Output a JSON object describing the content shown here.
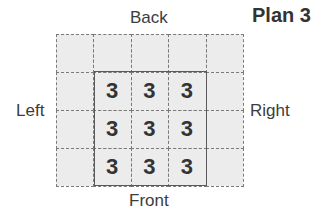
{
  "title": "Plan 3",
  "labels": {
    "back": "Back",
    "front": "Front",
    "left": "Left",
    "right": "Right"
  },
  "grid": {
    "cols": 5,
    "rows": 4,
    "cells": [
      [
        null,
        null,
        null,
        null,
        null
      ],
      [
        null,
        "3",
        "3",
        "3",
        null
      ],
      [
        null,
        "3",
        "3",
        "3",
        null
      ],
      [
        null,
        "3",
        "3",
        "3",
        null
      ]
    ]
  },
  "colors": {
    "fill": "#ececec",
    "dashed_line": "#7a7a7a",
    "solid_border": "#5a5a5a",
    "text": "#333333"
  }
}
